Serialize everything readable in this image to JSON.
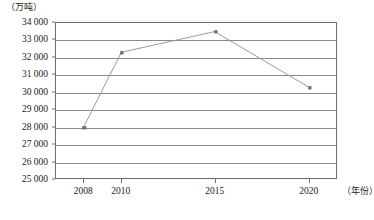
{
  "chart_data": {
    "type": "line",
    "title": "",
    "xlabel": "（年份）",
    "ylabel": "（万吨）",
    "x": [
      2008,
      2010,
      2015,
      2020
    ],
    "categories": [
      "2008",
      "2010",
      "2015",
      "2020"
    ],
    "values": [
      28000,
      32300,
      33500,
      30300
    ],
    "series": [
      {
        "name": "",
        "values": [
          28000,
          32300,
          33500,
          30300
        ]
      }
    ],
    "ylim": [
      25000,
      34000
    ],
    "xlim": [
      2006.5,
      2021.5
    ],
    "y_ticks": [
      25000,
      26000,
      27000,
      28000,
      29000,
      30000,
      31000,
      32000,
      33000,
      34000
    ],
    "y_tick_labels": [
      "25 000",
      "26 000",
      "27 000",
      "28 000",
      "29 000",
      "30 000",
      "31 000",
      "32 000",
      "33 000",
      "34 000"
    ],
    "x_ticks": [
      2008,
      2010,
      2015,
      2020
    ],
    "x_tick_labels": [
      "2008",
      "2010",
      "2015",
      "2020"
    ],
    "grid": true,
    "grid_axis": "y",
    "legend": false,
    "legend_position": "none",
    "line_color": "#9a9a9a",
    "marker_color": "#8c8c8c",
    "marker_shape": "square",
    "axis_color": "#6e6e6e",
    "gridline_color": "#8a8a8a",
    "background_color": "#ffffff"
  },
  "axes": {
    "y_unit_label": "（万吨）",
    "x_unit_label": "（年份）"
  }
}
